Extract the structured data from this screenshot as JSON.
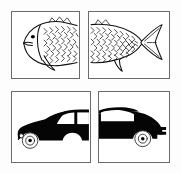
{
  "sheet": {
    "title": "Object half-image stimulus sheet",
    "background_color": "#fdfdfd",
    "rows": 2,
    "columns": 2,
    "panel_border_color": "#6b6b6b",
    "ink_color": "#050505"
  },
  "panels": [
    {
      "id": "fish-head",
      "position": "top-left",
      "object": "fish",
      "part": "front half (head)",
      "style": "line drawing with scale hatching",
      "alt": "Outline drawing of the head end of a fish facing left, with eye, mouth, gill arc, dorsal fin start, pectoral fin and cross-hatched scales",
      "features": [
        "eye",
        "mouth",
        "gill-arc",
        "pectoral-fin",
        "dorsal-fin-front",
        "scale-hatching"
      ],
      "fill": "white",
      "x": 11,
      "y": 11,
      "width": 69,
      "height": 68
    },
    {
      "id": "fish-tail",
      "position": "top-right",
      "object": "fish",
      "part": "back half (tail)",
      "style": "line drawing with scale hatching",
      "alt": "Outline drawing of the tail end of a fish with cross-hatched scales on the left and a forked caudal fin on the right",
      "features": [
        "scale-hatching",
        "caudal-fin",
        "anal-fin",
        "dorsal-fin-rear"
      ],
      "fill": "white",
      "x": 88,
      "y": 11,
      "width": 82,
      "height": 68
    },
    {
      "id": "car-front",
      "position": "bottom-left",
      "object": "car",
      "part": "front half",
      "style": "solid black silhouette",
      "alt": "Black silhouette of the front half of a sedan facing left, showing hood, windshield, front side window, front wheel and a small white headlight",
      "features": [
        "hood",
        "windshield",
        "front-side-window",
        "front-wheel",
        "headlight"
      ],
      "fill": "black",
      "x": 11,
      "y": 91,
      "width": 80,
      "height": 72
    },
    {
      "id": "car-rear",
      "position": "bottom-right",
      "object": "car",
      "part": "back half",
      "style": "solid black silhouette",
      "alt": "Black silhouette of the rear half of a sedan, showing roof, rear side window, trunk, rear wheel and a notched rear bumper",
      "features": [
        "roof",
        "rear-side-window",
        "trunk",
        "rear-wheel",
        "rear-bumper"
      ],
      "fill": "black",
      "x": 98,
      "y": 91,
      "width": 72,
      "height": 72
    }
  ]
}
